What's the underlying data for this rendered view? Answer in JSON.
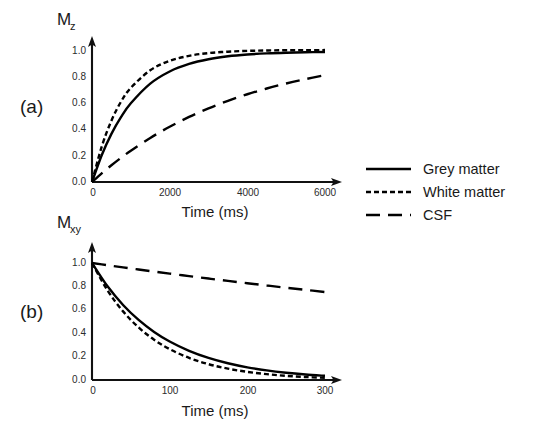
{
  "figure": {
    "background_color": "#ffffff",
    "line_color": "#000000",
    "panel_a_label": "(a)",
    "panel_b_label": "(b)"
  },
  "legend": {
    "position": "right-middle",
    "entries": [
      {
        "label": "Grey matter",
        "style": "solid",
        "dasharray": ""
      },
      {
        "label": "White matter",
        "style": "short-dash",
        "dasharray": "5,3"
      },
      {
        "label": "CSF",
        "style": "long-dash",
        "dasharray": "14,8"
      }
    ]
  },
  "chart_data": [
    {
      "type": "line",
      "panel": "(a)",
      "title": "",
      "xlabel": "Time (ms)",
      "ylabel": "Mz",
      "ylabel_base": "M",
      "ylabel_sub": "z",
      "xlim": [
        0,
        6000
      ],
      "ylim": [
        0.0,
        1.0
      ],
      "grid": false,
      "xticks": [
        0,
        2000,
        4000,
        6000
      ],
      "xticklabels": [
        "0",
        "2000",
        "4000",
        "6000"
      ],
      "yticks": [
        0.0,
        0.2,
        0.4,
        0.6,
        0.8,
        1.0
      ],
      "yticklabels": [
        "0.0",
        "0.2",
        "0.4",
        "0.6",
        "0.8",
        "1.0"
      ],
      "x": [
        0,
        250,
        500,
        750,
        1000,
        1500,
        2000,
        2500,
        3000,
        3500,
        4000,
        4500,
        5000,
        5500,
        6000
      ],
      "series": [
        {
          "name": "Grey matter",
          "style": "solid",
          "dasharray": "",
          "relaxation_time_ms": 1100,
          "model": "1 - exp(-t/T1)",
          "values": [
            0.0,
            0.2029,
            0.3647,
            0.4936,
            0.5964,
            0.7452,
            0.8375,
            0.8947,
            0.9302,
            0.9522,
            0.9659,
            0.9743,
            0.9795,
            0.9827,
            0.9847
          ]
        },
        {
          "name": "White matter",
          "style": "short-dash",
          "dasharray": "5,3",
          "relaxation_time_ms": 800,
          "model": "1 - exp(-t/T1)",
          "values": [
            0.0,
            0.2675,
            0.4647,
            0.6099,
            0.7135,
            0.8466,
            0.9179,
            0.9558,
            0.9765,
            0.9873,
            0.9933,
            0.9964,
            0.9981,
            0.999,
            0.9995
          ]
        },
        {
          "name": "CSF",
          "style": "long-dash",
          "dasharray": "14,8",
          "relaxation_time_ms": 3700,
          "model": "1 - exp(-t/T1)",
          "values": [
            0.0,
            0.0654,
            0.1265,
            0.1836,
            0.2369,
            0.3339,
            0.4187,
            0.493,
            0.558,
            0.6149,
            0.6647,
            0.7083,
            0.7464,
            0.7798,
            0.809
          ]
        }
      ]
    },
    {
      "type": "line",
      "panel": "(b)",
      "title": "",
      "xlabel": "Time (ms)",
      "ylabel": "Mxy",
      "ylabel_base": "M",
      "ylabel_sub": "xy",
      "xlim": [
        0,
        300
      ],
      "ylim": [
        0.0,
        1.0
      ],
      "grid": false,
      "xticks": [
        0,
        100,
        200,
        300
      ],
      "xticklabels": [
        "0",
        "100",
        "200",
        "300"
      ],
      "yticks": [
        0.0,
        0.2,
        0.4,
        0.6,
        0.8,
        1.0
      ],
      "yticklabels": [
        "0.0",
        "0.2",
        "0.4",
        "0.6",
        "0.8",
        "1.0"
      ],
      "x": [
        0,
        20,
        40,
        60,
        80,
        100,
        125,
        150,
        175,
        200,
        225,
        250,
        275,
        300
      ],
      "series": [
        {
          "name": "Grey matter",
          "style": "solid",
          "dasharray": "",
          "relaxation_time_ms": 90,
          "model": "exp(-t/T2)",
          "values": [
            1.0,
            0.8007,
            0.6412,
            0.5134,
            0.4111,
            0.3292,
            0.2494,
            0.1889,
            0.1431,
            0.1084,
            0.0821,
            0.0622,
            0.0471,
            0.0357
          ]
        },
        {
          "name": "White matter",
          "style": "short-dash",
          "dasharray": "5,3",
          "relaxation_time_ms": 75,
          "model": "exp(-t/T2)",
          "values": [
            1.0,
            0.7659,
            0.5866,
            0.4493,
            0.3442,
            0.2636,
            0.1889,
            0.1353,
            0.097,
            0.0695,
            0.0498,
            0.0357,
            0.0256,
            0.0183
          ]
        },
        {
          "name": "CSF",
          "style": "long-dash",
          "dasharray": "14,8",
          "relaxation_time_ms": 1050,
          "model": "exp(-t/T2)",
          "values": [
            1.0,
            0.9811,
            0.9627,
            0.9445,
            0.9268,
            0.9093,
            0.888,
            0.8672,
            0.8469,
            0.827,
            0.8076,
            0.7887,
            0.7702,
            0.752
          ]
        }
      ]
    }
  ]
}
